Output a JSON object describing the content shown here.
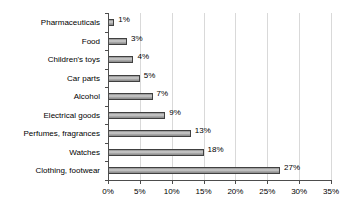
{
  "chart_data": {
    "type": "bar",
    "orientation": "horizontal",
    "title": "",
    "xlabel": "",
    "ylabel": "",
    "categories": [
      "Pharmaceuticals",
      "Food",
      "Children's toys",
      "Car parts",
      "Alcohol",
      "Electrical goods",
      "Perfumes, fragrances",
      "Watches",
      "Clothing, footwear"
    ],
    "values": [
      1,
      3,
      4,
      5,
      7,
      9,
      13,
      15,
      27
    ],
    "data_labels": [
      "1%",
      "3%",
      "4%",
      "5%",
      "7%",
      "9%",
      "13%",
      "18%",
      "27%"
    ],
    "xlim": [
      0,
      35
    ],
    "xticks": [
      0,
      5,
      10,
      15,
      20,
      25,
      30,
      35
    ],
    "xtick_labels": [
      "0%",
      "5%",
      "10%",
      "15%",
      "20%",
      "25%",
      "30%",
      "35%"
    ],
    "grid": true,
    "grid_axis": "x",
    "legend": false,
    "colors": {
      "bar_fill": "#a6a6a6",
      "bar_border": "#404040",
      "gridline": "#d9d9d9",
      "axis": "#4d4d4d",
      "text": "#000000",
      "background": "#ffffff"
    }
  }
}
